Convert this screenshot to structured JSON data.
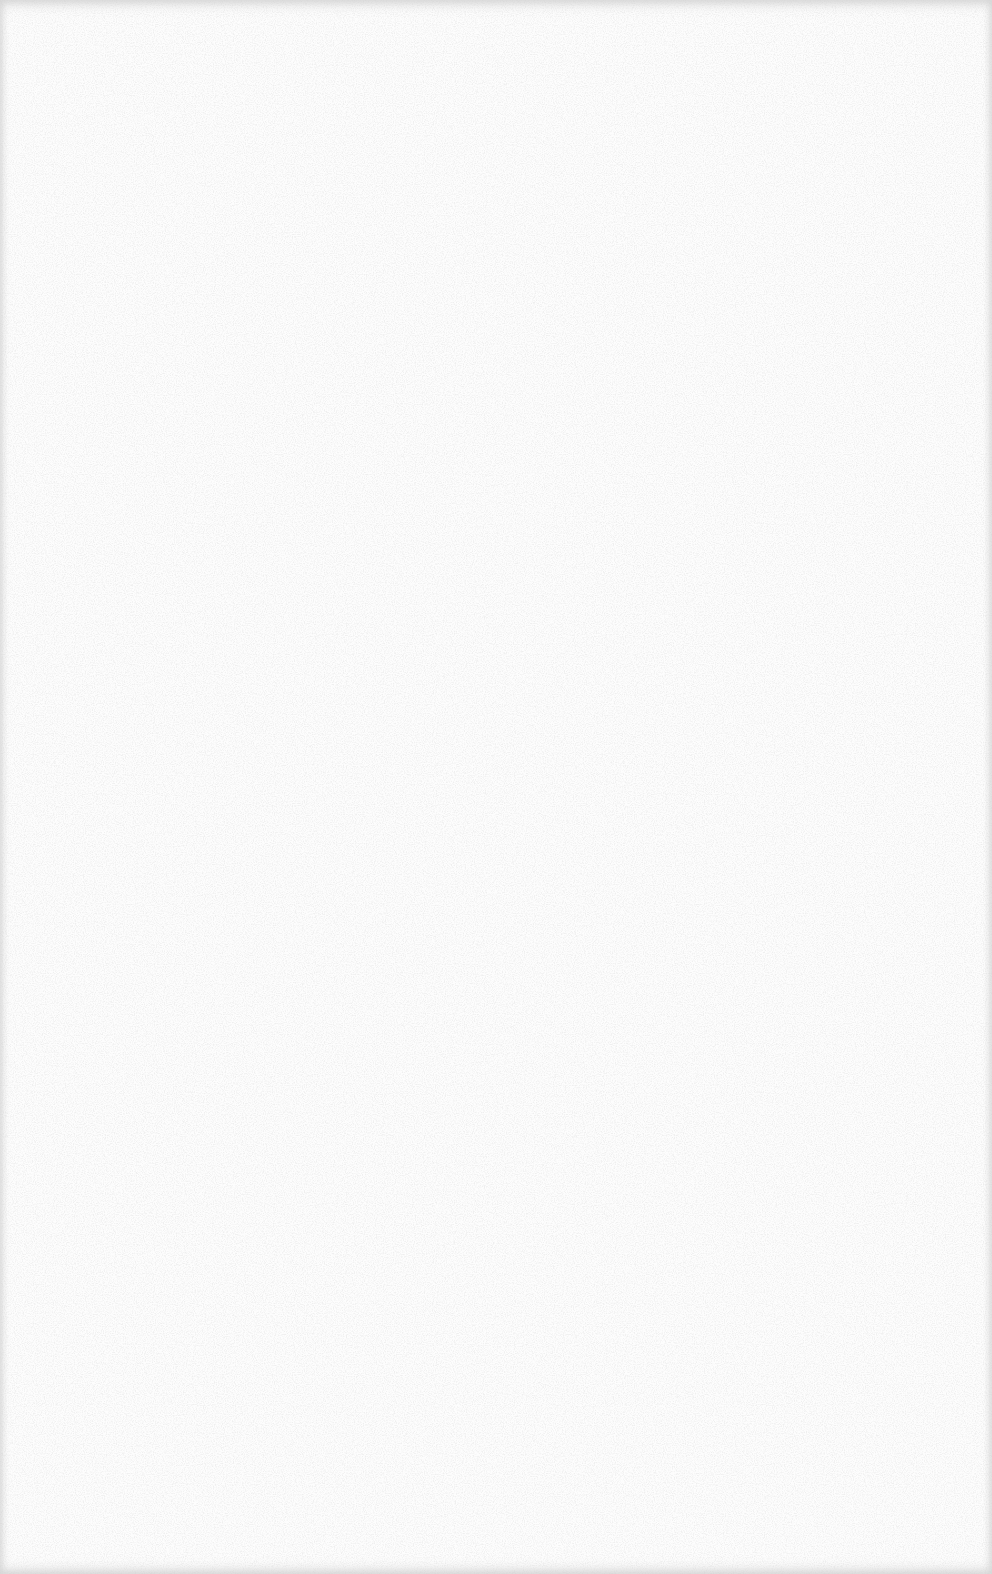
{
  "page": {
    "type": "blank-scanned-sheet",
    "content": [],
    "colors": {
      "paper": "#fdfdfd",
      "speckle": "#d0d0d0",
      "edge_shadow": "#c8c8c8"
    }
  }
}
